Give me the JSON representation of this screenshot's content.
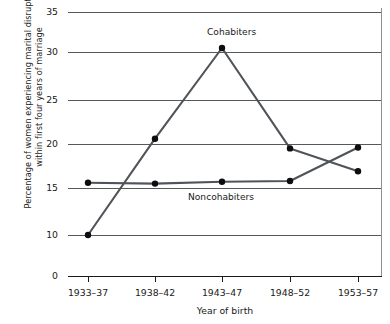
{
  "chart_data": {
    "type": "line",
    "title": "",
    "xlabel": "Year of birth",
    "ylabel": "Percentage of women experiencing marital disruption within first four years of marriage",
    "categories": [
      "1933–37",
      "1938–42",
      "1943–47",
      "1948–52",
      "1953–57"
    ],
    "yticks": [
      0,
      10,
      15,
      20,
      25,
      30,
      35
    ],
    "ylim": [
      0,
      35
    ],
    "y_axis_has_break": true,
    "grid": true,
    "legend": "inline-annotations",
    "series": [
      {
        "name": "Cohabiters",
        "values": [
          10.0,
          20.6,
          30.5,
          19.5,
          16.9
        ],
        "color": "#50545a",
        "marker": "filled-circle"
      },
      {
        "name": "Noncohabiters",
        "values": [
          15.6,
          15.5,
          15.7,
          15.8,
          19.6
        ],
        "color": "#50545a",
        "marker": "filled-circle"
      }
    ],
    "annotations": [
      {
        "text": "Cohabiters",
        "series": "Cohabiters",
        "near_category": "1943–47"
      },
      {
        "text": "Noncohabiters",
        "series": "Noncohabiters",
        "near_category": "1943–47"
      }
    ]
  }
}
